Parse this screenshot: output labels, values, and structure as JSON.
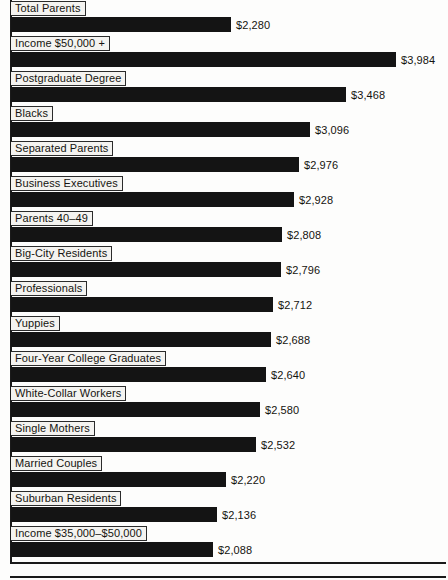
{
  "chart_data": {
    "type": "bar",
    "orientation": "horizontal",
    "title": "",
    "subtitle": "",
    "xlabel": "",
    "ylabel": "",
    "grid": false,
    "legend": null,
    "value_prefix": "$",
    "xlim": [
      0,
      3984
    ],
    "categories": [
      "Total Parents",
      "Income $50,000 +",
      "Postgraduate Degree",
      "Blacks",
      "Separated Parents",
      "Business Executives",
      "Parents 40–49",
      "Big-City Residents",
      "Professionals",
      "Yuppies",
      "Four-Year College Graduates",
      "White-Collar Workers",
      "Single Mothers",
      "Married Couples",
      "Suburban Residents",
      "Income $35,000–$50,000"
    ],
    "values": [
      2280,
      3984,
      3468,
      3096,
      2976,
      2928,
      2808,
      2796,
      2712,
      2688,
      2640,
      2580,
      2532,
      2220,
      2136,
      2088
    ],
    "value_labels": [
      "$2,280",
      "$3,984",
      "$3,468",
      "$3,096",
      "$2,976",
      "$2,928",
      "$2,808",
      "$2,796",
      "$2,712",
      "$2,688",
      "$2,640",
      "$2,580",
      "$2,532",
      "$2,220",
      "$2,136",
      "$2,088"
    ],
    "rows": [
      {
        "label": "Total Parents",
        "value": 2280,
        "value_label": "$2,280"
      },
      {
        "label": "Income $50,000 +",
        "value": 3984,
        "value_label": "$3,984"
      },
      {
        "label": "Postgraduate Degree",
        "value": 3468,
        "value_label": "$3,468"
      },
      {
        "label": "Blacks",
        "value": 3096,
        "value_label": "$3,096"
      },
      {
        "label": "Separated Parents",
        "value": 2976,
        "value_label": "$2,976"
      },
      {
        "label": "Business Executives",
        "value": 2928,
        "value_label": "$2,928"
      },
      {
        "label": "Parents 40–49",
        "value": 2808,
        "value_label": "$2,808"
      },
      {
        "label": "Big-City Residents",
        "value": 2796,
        "value_label": "$2,796"
      },
      {
        "label": "Professionals",
        "value": 2712,
        "value_label": "$2,712"
      },
      {
        "label": "Yuppies",
        "value": 2688,
        "value_label": "$2,688"
      },
      {
        "label": "Four-Year College Graduates",
        "value": 2640,
        "value_label": "$2,640"
      },
      {
        "label": "White-Collar Workers",
        "value": 2580,
        "value_label": "$2,580"
      },
      {
        "label": "Single Mothers",
        "value": 2532,
        "value_label": "$2,532"
      },
      {
        "label": "Married Couples",
        "value": 2220,
        "value_label": "$2,220"
      },
      {
        "label": "Suburban Residents",
        "value": 2136,
        "value_label": "$2,136"
      },
      {
        "label": "Income $35,000–$50,000",
        "value": 2088,
        "value_label": "$2,088"
      }
    ]
  },
  "style": {
    "bar_color": "#141414",
    "label_plate_color": "#f4f3f0",
    "rule_color": "#1a1a1a",
    "background": "#fdfdfc",
    "text_color": "#15130f"
  }
}
